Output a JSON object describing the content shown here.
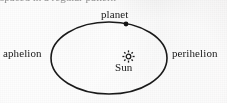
{
  "figure": {
    "background_color": "#f2f2f2",
    "stroke_color": "#1a1a1a",
    "text_color": "#191919",
    "partial_top_line": "spaced in a regular pattern",
    "labels": {
      "planet": "planet",
      "aphelion": "aphelion",
      "perihelion": "perihelion",
      "sun": "Sun"
    },
    "icons": {
      "sun": "sun-icon",
      "planet_marker": "planet-dot-icon"
    },
    "geometry": {
      "ellipse_center_x": 109,
      "ellipse_center_y": 58,
      "ellipse_radius_x": 58,
      "ellipse_radius_y": 36,
      "ellipse_stroke_width": 1.6,
      "sun_focus_x": 128,
      "sun_focus_y": 57,
      "planet_marker_x": 126,
      "planet_marker_y": 24,
      "planet_marker_radius": 2.4
    }
  }
}
